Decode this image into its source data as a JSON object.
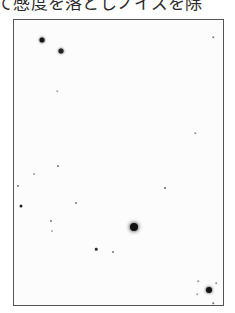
{
  "caption": {
    "text": "て感度を落としノイズを除"
  },
  "photo": {
    "description": "star-field",
    "border_color": "#555555",
    "stars": [
      {
        "x": 42,
        "y": 40,
        "size": 5,
        "color": "#151515"
      },
      {
        "x": 61,
        "y": 51,
        "size": 5,
        "color": "#222222"
      },
      {
        "x": 57,
        "y": 91,
        "size": 1.5,
        "color": "#aaaaaa"
      },
      {
        "x": 213,
        "y": 37,
        "size": 1.5,
        "color": "#888888"
      },
      {
        "x": 195,
        "y": 133,
        "size": 1.5,
        "color": "#999999"
      },
      {
        "x": 58,
        "y": 166,
        "size": 2,
        "color": "#777777"
      },
      {
        "x": 34,
        "y": 174,
        "size": 2,
        "color": "#999999"
      },
      {
        "x": 165,
        "y": 188,
        "size": 2,
        "color": "#666666"
      },
      {
        "x": 18,
        "y": 186,
        "size": 2,
        "color": "#777777"
      },
      {
        "x": 76,
        "y": 203,
        "size": 2,
        "color": "#777777"
      },
      {
        "x": 21,
        "y": 206,
        "size": 3,
        "color": "#222222"
      },
      {
        "x": 51,
        "y": 221,
        "size": 2,
        "color": "#777777"
      },
      {
        "x": 52,
        "y": 231,
        "size": 2,
        "color": "#aaaaaa"
      },
      {
        "x": 134,
        "y": 227,
        "size": 8,
        "color": "#111111"
      },
      {
        "x": 96,
        "y": 249,
        "size": 2.5,
        "color": "#333333"
      },
      {
        "x": 113,
        "y": 252,
        "size": 2,
        "color": "#777777"
      },
      {
        "x": 209,
        "y": 290,
        "size": 6,
        "color": "#151515"
      },
      {
        "x": 198,
        "y": 281,
        "size": 1.5,
        "color": "#999999"
      },
      {
        "x": 216,
        "y": 283,
        "size": 1.5,
        "color": "#999999"
      },
      {
        "x": 213,
        "y": 303,
        "size": 1.5,
        "color": "#777777"
      },
      {
        "x": 197,
        "y": 294,
        "size": 1.5,
        "color": "#aaaaaa"
      }
    ]
  }
}
